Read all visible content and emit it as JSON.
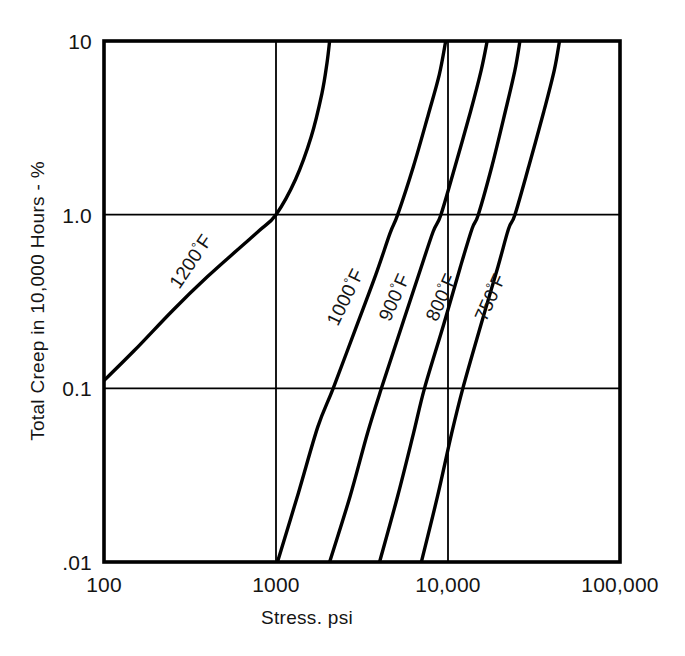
{
  "chart_data": {
    "type": "line",
    "title": "",
    "subtitle": "",
    "xlabel": "Stress. psi",
    "ylabel": "Total Creep in 10,000 Hours - %",
    "xscale": "log",
    "yscale": "log",
    "xlim": [
      100,
      100000
    ],
    "ylim": [
      0.01,
      10
    ],
    "grid": true,
    "grid_x_values": [
      1000,
      10000
    ],
    "grid_y_values": [
      0.1,
      1.0
    ],
    "legend_position": "inline-curve-labels",
    "xticks": [
      {
        "value": 100,
        "label": "100"
      },
      {
        "value": 1000,
        "label": "1000"
      },
      {
        "value": 10000,
        "label": "10,000"
      },
      {
        "value": 100000,
        "label": "100,000"
      }
    ],
    "yticks": [
      {
        "value": 10,
        "label": "10"
      },
      {
        "value": 1.0,
        "label": "1.0"
      },
      {
        "value": 0.1,
        "label": "0.1"
      },
      {
        "value": 0.01,
        "label": ".01"
      }
    ],
    "series": [
      {
        "name": "1200°F",
        "label_number": "1200",
        "label_degree": "°",
        "label_unit": "F",
        "points": [
          {
            "stress": 90,
            "creep": 0.1
          },
          {
            "stress": 150,
            "creep": 0.165
          },
          {
            "stress": 250,
            "creep": 0.28
          },
          {
            "stress": 400,
            "creep": 0.44
          },
          {
            "stress": 600,
            "creep": 0.63
          },
          {
            "stress": 800,
            "creep": 0.81
          },
          {
            "stress": 1000,
            "creep": 1.0
          },
          {
            "stress": 1300,
            "creep": 1.6
          },
          {
            "stress": 1600,
            "creep": 2.8
          },
          {
            "stress": 1850,
            "creep": 5.0
          },
          {
            "stress": 1980,
            "creep": 7.5
          },
          {
            "stress": 2050,
            "creep": 10
          }
        ]
      },
      {
        "name": "1000°F",
        "label_number": "1000",
        "label_degree": "°",
        "label_unit": "F",
        "points": [
          {
            "stress": 1020,
            "creep": 0.01
          },
          {
            "stress": 1350,
            "creep": 0.025
          },
          {
            "stress": 1750,
            "creep": 0.06
          },
          {
            "stress": 2150,
            "creep": 0.1
          },
          {
            "stress": 2900,
            "creep": 0.22
          },
          {
            "stress": 3800,
            "creep": 0.45
          },
          {
            "stress": 4600,
            "creep": 0.78
          },
          {
            "stress": 5100,
            "creep": 1.0
          },
          {
            "stress": 6300,
            "creep": 1.9
          },
          {
            "stress": 7700,
            "creep": 3.8
          },
          {
            "stress": 8900,
            "creep": 6.4
          },
          {
            "stress": 9700,
            "creep": 10
          }
        ]
      },
      {
        "name": "900°F",
        "label_number": "900",
        "label_degree": "°",
        "label_unit": "F",
        "points": [
          {
            "stress": 2050,
            "creep": 0.01
          },
          {
            "stress": 2700,
            "creep": 0.024
          },
          {
            "stress": 3400,
            "creep": 0.055
          },
          {
            "stress": 4100,
            "creep": 0.1
          },
          {
            "stress": 5400,
            "creep": 0.23
          },
          {
            "stress": 6900,
            "creep": 0.48
          },
          {
            "stress": 8200,
            "creep": 0.8
          },
          {
            "stress": 9100,
            "creep": 1.0
          },
          {
            "stress": 11000,
            "creep": 1.9
          },
          {
            "stress": 13500,
            "creep": 3.9
          },
          {
            "stress": 15600,
            "creep": 6.8
          },
          {
            "stress": 16900,
            "creep": 10
          }
        ]
      },
      {
        "name": "800°F",
        "label_number": "800",
        "label_degree": "°",
        "label_unit": "F",
        "points": [
          {
            "stress": 4000,
            "creep": 0.01
          },
          {
            "stress": 5100,
            "creep": 0.024
          },
          {
            "stress": 6300,
            "creep": 0.055
          },
          {
            "stress": 7300,
            "creep": 0.1
          },
          {
            "stress": 9400,
            "creep": 0.23
          },
          {
            "stress": 11800,
            "creep": 0.5
          },
          {
            "stress": 13800,
            "creep": 0.83
          },
          {
            "stress": 15000,
            "creep": 1.0
          },
          {
            "stress": 18000,
            "creep": 1.9
          },
          {
            "stress": 21500,
            "creep": 3.9
          },
          {
            "stress": 24500,
            "creep": 6.8
          },
          {
            "stress": 26200,
            "creep": 10
          }
        ]
      },
      {
        "name": "750°F",
        "label_number": "750",
        "label_degree": "°",
        "label_unit": "F",
        "points": [
          {
            "stress": 7000,
            "creep": 0.01
          },
          {
            "stress": 8700,
            "creep": 0.024
          },
          {
            "stress": 10500,
            "creep": 0.055
          },
          {
            "stress": 12200,
            "creep": 0.1
          },
          {
            "stress": 15500,
            "creep": 0.23
          },
          {
            "stress": 19500,
            "creep": 0.5
          },
          {
            "stress": 22500,
            "creep": 0.83
          },
          {
            "stress": 24500,
            "creep": 1.0
          },
          {
            "stress": 29500,
            "creep": 1.9
          },
          {
            "stress": 36000,
            "creep": 3.9
          },
          {
            "stress": 41500,
            "creep": 6.8
          },
          {
            "stress": 44500,
            "creep": 10
          }
        ]
      }
    ],
    "colors": {
      "curve": "#000000",
      "frame": "#000000",
      "grid": "#000000",
      "background": "#ffffff",
      "text": "#141414"
    }
  }
}
